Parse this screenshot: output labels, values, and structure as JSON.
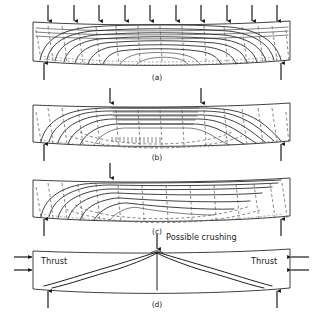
{
  "figure": {
    "type": "engineering-stress-trajectory-diagram",
    "background_color": "#ffffff",
    "line_color": "#1f1f1f",
    "dashed_line_color": "#555555",
    "width": 314,
    "height": 323
  },
  "panels": [
    {
      "id": "a",
      "label": "(a)",
      "label_x": 157,
      "label_y": 80,
      "loading": "uniformly distributed load",
      "beam": {
        "left": 33,
        "right": 290,
        "top": 22,
        "bottom": 62,
        "mid_y": 42
      },
      "load_arrows_down": [
        48,
        74,
        99,
        125,
        150,
        176,
        201,
        227,
        252,
        277
      ],
      "load_arrow_top": 5,
      "load_arrow_bottom": 21,
      "support_arrows_up": [
        44,
        281
      ],
      "support_arrow_top": 63,
      "support_arrow_bottom": 80
    },
    {
      "id": "b",
      "label": "(b)",
      "label_x": 157,
      "label_y": 160,
      "loading": "two point loads",
      "beam": {
        "left": 33,
        "right": 290,
        "top": 104,
        "bottom": 143,
        "mid_y": 123
      },
      "load_arrows_down": [
        110,
        201
      ],
      "load_arrow_top": 88,
      "load_arrow_bottom": 103,
      "support_arrows_up": [
        44,
        281
      ],
      "support_arrow_top": 144,
      "support_arrow_bottom": 161
    },
    {
      "id": "c",
      "label": "(c)",
      "label_x": 157,
      "label_y": 234,
      "loading": "central point load",
      "beam": {
        "left": 33,
        "right": 290,
        "top": 179,
        "bottom": 218,
        "mid_y": 198
      },
      "load_arrows_down": [
        110
      ],
      "load_arrow_top": 163,
      "load_arrow_bottom": 178,
      "support_arrows_up": [
        44,
        281
      ],
      "support_arrow_top": 219,
      "support_arrow_bottom": 236
    },
    {
      "id": "d",
      "label": "(d)",
      "label_x": 157,
      "label_y": 307,
      "loading": "arching action with horizontal thrust",
      "beam": {
        "left": 33,
        "right": 290,
        "top": 250,
        "bottom": 290,
        "mid_y": 270
      },
      "load_arrows_down": [
        157
      ],
      "load_arrow_top": 234,
      "load_arrow_bottom": 249,
      "support_arrows_up": [
        48,
        277
      ],
      "support_arrow_top": 291,
      "support_arrow_bottom": 308
    }
  ],
  "annotations": {
    "possible_crushing": {
      "text": "Possible crushing",
      "x": 166,
      "y": 240
    },
    "thrust_left": {
      "text": "Thrust",
      "x": 41,
      "y": 264
    },
    "thrust_right": {
      "text": "Thrust",
      "x": 251,
      "y": 264
    },
    "thrust_arrows_left": {
      "rows_y": [
        257,
        270
      ],
      "x_start": 14,
      "x_end": 32
    },
    "thrust_arrows_right": {
      "rows_y": [
        257,
        270
      ],
      "x_start": 309,
      "x_end": 291
    }
  },
  "legend": {
    "solid_lines": "compressive principal stress trajectories",
    "dashed_lines": "tensile principal stress trajectories"
  }
}
